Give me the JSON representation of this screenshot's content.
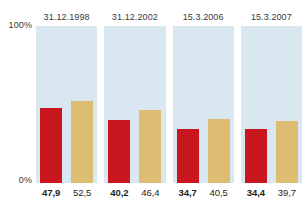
{
  "chart_data": {
    "type": "bar",
    "title": "",
    "xlabel": "",
    "ylabel": "",
    "ylim": [
      0,
      100
    ],
    "grid": false,
    "legend_position": "none",
    "categories": [
      "31.12.1998",
      "31.12.2002",
      "15.3.2006",
      "15.3.2007"
    ],
    "y_tick_labels": [
      "100%",
      "0%"
    ],
    "series": [
      {
        "name": "red",
        "color": "#c8171e",
        "values": [
          47.9,
          40.2,
          34.7,
          34.4
        ],
        "value_labels": [
          "47,9",
          "40,2",
          "34,7",
          "34,4"
        ]
      },
      {
        "name": "tan",
        "color": "#ddbd71",
        "values": [
          52.5,
          46.4,
          40.5,
          39.7
        ],
        "value_labels": [
          "52,5",
          "46,4",
          "40,5",
          "39,7"
        ]
      }
    ],
    "panel_background": "#d8e7f0"
  },
  "axis": {
    "top_label": "100%",
    "bottom_label": "0%"
  },
  "panels": [
    {
      "header": "31.12.1998",
      "bars": [
        {
          "series": "red",
          "value": 47.9,
          "label": "47,9"
        },
        {
          "series": "tan",
          "value": 52.5,
          "label": "52,5"
        }
      ]
    },
    {
      "header": "31.12.2002",
      "bars": [
        {
          "series": "red",
          "value": 40.2,
          "label": "40,2"
        },
        {
          "series": "tan",
          "value": 46.4,
          "label": "46,4"
        }
      ]
    },
    {
      "header": "15.3.2006",
      "bars": [
        {
          "series": "red",
          "value": 34.7,
          "label": "34,7"
        },
        {
          "series": "tan",
          "value": 40.5,
          "label": "40,5"
        }
      ]
    },
    {
      "header": "15.3.2007",
      "bars": [
        {
          "series": "red",
          "value": 34.4,
          "label": "34,4"
        },
        {
          "series": "tan",
          "value": 39.7,
          "label": "39,7"
        }
      ]
    }
  ]
}
